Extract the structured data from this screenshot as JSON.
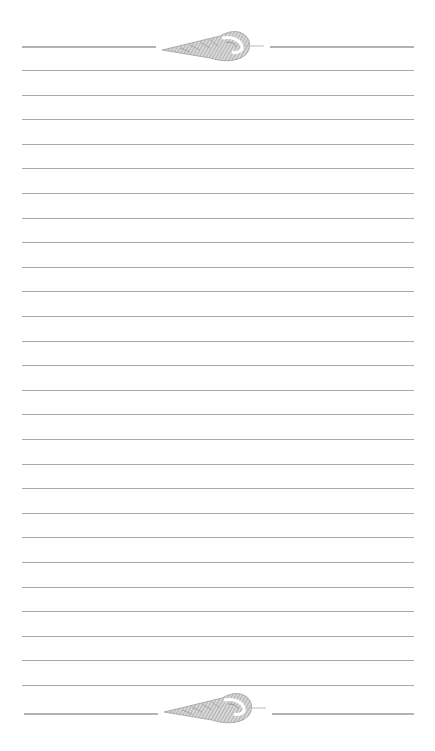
{
  "stationery": {
    "type": "lined-notepaper",
    "line_count": 26,
    "line_color": "#9a9a9a",
    "border_color": "#b3b3b3",
    "top_ornament": {
      "icon": "seashell-icon"
    },
    "bottom_ornament": {
      "icon": "seashell-icon"
    }
  }
}
